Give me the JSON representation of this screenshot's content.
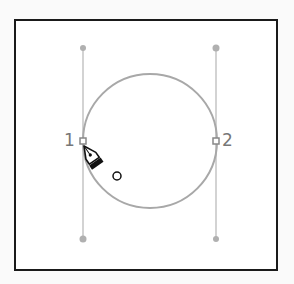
{
  "diagram": {
    "anchor_points": [
      {
        "label": "1",
        "x": 83,
        "y": 141
      },
      {
        "label": "2",
        "x": 216,
        "y": 141
      }
    ],
    "circle": {
      "cx": 150,
      "cy": 141,
      "r": 67,
      "stroke": "#a8a8a8"
    },
    "handles": [
      {
        "x": 83,
        "y1": 48,
        "y2": 239
      },
      {
        "x": 216,
        "y1": 48,
        "y2": 239
      }
    ],
    "cursor": {
      "type": "pen-tool-icon",
      "modifier": "circle"
    },
    "colors": {
      "frame": "#1a1a1a",
      "path": "#a8a8a8",
      "handle": "#bdbdbd",
      "label": "#777777"
    }
  }
}
